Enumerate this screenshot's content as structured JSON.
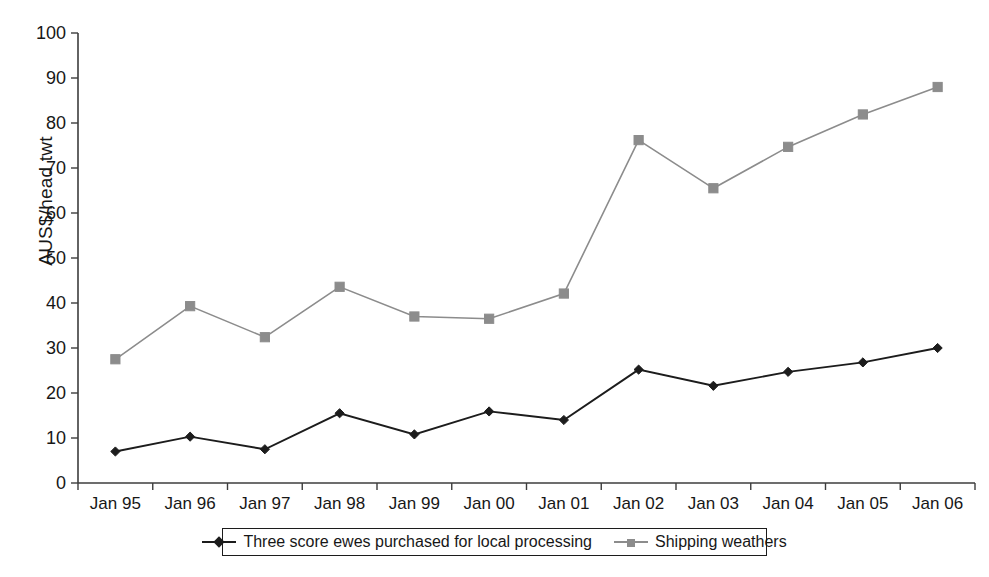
{
  "chart_data": {
    "type": "line",
    "title": "",
    "xlabel": "",
    "ylabel": "AUS$/head twt",
    "ylim": [
      0,
      100
    ],
    "ytick_step": 10,
    "yticks": [
      "0",
      "10",
      "20",
      "30",
      "40",
      "50",
      "60",
      "70",
      "80",
      "90",
      "100"
    ],
    "grid": false,
    "legend_position": "bottom",
    "categories": [
      "Jan 95",
      "Jan 96",
      "Jan 97",
      "Jan 98",
      "Jan 99",
      "Jan 00",
      "Jan 01",
      "Jan 02",
      "Jan 03",
      "Jan 04",
      "Jan 05",
      "Jan 06"
    ],
    "series": [
      {
        "name": "Three score ewes purchased for local processing",
        "color": "#1c1c1c",
        "marker": "diamond",
        "values": [
          7.0,
          10.3,
          7.5,
          15.5,
          10.8,
          15.9,
          14.0,
          25.2,
          21.6,
          24.7,
          26.8,
          30.0
        ]
      },
      {
        "name": "Shipping weathers",
        "color": "#8c8c8c",
        "marker": "square",
        "values": [
          27.5,
          39.3,
          32.4,
          43.6,
          37.0,
          36.5,
          42.1,
          76.2,
          65.5,
          74.7,
          81.9,
          88.0
        ]
      }
    ]
  },
  "legend": {
    "items": [
      {
        "label": "Three score ewes purchased for local processing",
        "marker": "diamond-marker-icon"
      },
      {
        "label": "Shipping weathers",
        "marker": "square-marker-icon"
      }
    ]
  },
  "colors": {
    "series_one": "#1c1c1c",
    "series_two": "#8c8c8c",
    "axis": "#3d3d3d",
    "text": "#171717",
    "background": "#ffffff"
  }
}
